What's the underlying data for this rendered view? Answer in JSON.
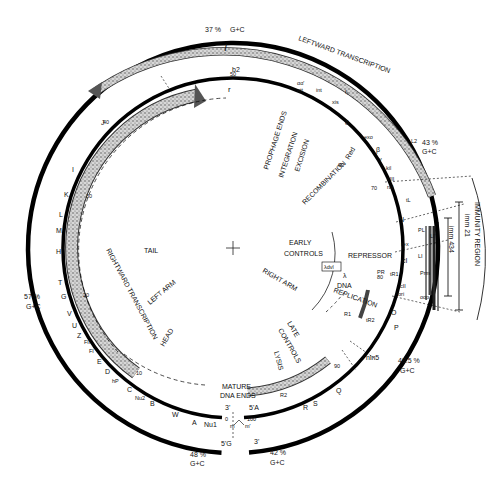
{
  "diagram": {
    "center": "+",
    "gc_content": [
      {
        "value": "37 %",
        "label": "G+C",
        "pos": "top"
      },
      {
        "value": "43 %",
        "label": "G+C",
        "pos": "right-upper"
      },
      {
        "value": "57 %",
        "label": "G+C",
        "pos": "left"
      },
      {
        "value": "48.5 %",
        "label": "G+C",
        "pos": "right-lower"
      },
      {
        "value": "48 %",
        "label": "G+C",
        "pos": "bottom-left"
      },
      {
        "value": "42 %",
        "label": "G+C",
        "pos": "bottom-right"
      }
    ],
    "strand_labels": {
      "l": "l",
      "r": "r"
    },
    "transcription": {
      "leftward": "LEFTWARD TRANSCRIPTION",
      "rightward": "RIGHTWARD TRANSCRIPTION"
    },
    "outer_genes": [
      "b2",
      "int",
      "xis",
      "exo",
      "β",
      "γ",
      "kil",
      "cIII",
      "ral",
      "N",
      "rex",
      "cI",
      "Prm",
      "cII",
      "O",
      "P",
      "Q",
      "S",
      "R",
      "A",
      "Nu1",
      "W",
      "B",
      "Nu2",
      "C",
      "hP",
      "D",
      "E",
      "FI",
      "FII",
      "Z",
      "U",
      "V",
      "G",
      "T",
      "H",
      "M",
      "L",
      "K",
      "I",
      "J"
    ],
    "inner_labels": {
      "int": "int",
      "xis": "xis",
      "att": "att",
      "aa": "αα'",
      "delta": "δ",
      "exo": "exo",
      "beta": "β",
      "gamma": "γ",
      "kil": "kil",
      "ciii": "cIII",
      "ral": "ral",
      "N": "N",
      "rex": "rex",
      "cI": "cI",
      "cII": "cII",
      "ori": "ori",
      "O": "O",
      "P": "P",
      "nin5": "nin5",
      "Q": "Q",
      "S": "S",
      "R": "R",
      "R1": "R1",
      "R2": "R2",
      "b2": "b2",
      "tL": "tL",
      "tR2": "tR2",
      "PL": "PL",
      "OL": "OL",
      "PR": "PR",
      "OR": "OR",
      "tR1": "tR1",
      "Pre": "Pre",
      "Prm": "Prm",
      "oop": "oop",
      "Po": "Po",
      "PR2": "P'R",
      "LI": "LI",
      "LI2": "LI'",
      "L2": "L2",
      "lit": "lit"
    },
    "scale": [
      "0",
      "10",
      "20",
      "30",
      "40",
      "50",
      "60",
      "70",
      "80",
      "90",
      "100"
    ],
    "functional_regions": {
      "prophage_ends": "PROPHAGE ENDS",
      "integration": "INTEGRATION",
      "excision": "EXCISION",
      "recombination": "RECOMBINATION",
      "red": "Red",
      "early_controls": "EARLY CONTROLS",
      "repressor": "REPRESSOR",
      "right_arm": "RIGHT ARM",
      "left_arm": "LEFT ARM",
      "dna_replication": "λ DNA REPLICATION",
      "late_controls": "LATE CONTROLS",
      "lysis": "LYSIS",
      "tail": "TAIL",
      "head": "HEAD",
      "mature_dna_ends": "MATURE DNA ENDS",
      "immunity_region": "IMMUNITY REGION",
      "imm21": "imm 21",
      "imm434": "imm 434",
      "hdvl": "λdvl"
    },
    "ends": {
      "three_prime_inner": "3'",
      "five_prime_A": "5'A",
      "five_prime_G": "5'G",
      "three_prime_outer": "3'",
      "m": "m",
      "m_prime": "m'",
      "zero": "0",
      "hundred": "100"
    }
  }
}
